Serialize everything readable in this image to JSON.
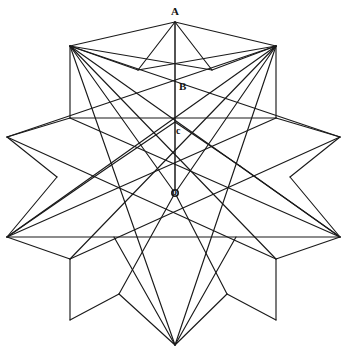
{
  "figure": {
    "type": "geometric-line-diagram",
    "canvas": {
      "width": 349,
      "height": 356,
      "background": "#ffffff"
    },
    "stroke_color": "#1a1a1a",
    "labels": [
      {
        "id": "A",
        "text": "A",
        "x": 175,
        "y": 13,
        "role": "apex-vertex"
      },
      {
        "id": "B",
        "text": "B",
        "x": 183,
        "y": 87,
        "role": "upper-intersection"
      },
      {
        "id": "c",
        "text": "c",
        "x": 180,
        "y": 131,
        "role": "mid-intersection"
      },
      {
        "id": "o",
        "text": "o",
        "x": 176,
        "y": 192,
        "role": "center-point"
      }
    ],
    "axis": {
      "label": "vertical-axis",
      "from": {
        "x": 175,
        "y": 22
      },
      "to": {
        "x": 175,
        "y": 193
      }
    },
    "center": {
      "x": 175,
      "y": 193
    },
    "outer_star_points": [
      {
        "name": "top",
        "x": 175,
        "y": 22
      },
      {
        "name": "upper-right-outer",
        "x": 340,
        "y": 137
      },
      {
        "name": "right-outer",
        "x": 340,
        "y": 237
      },
      {
        "name": "lower-right",
        "x": 276,
        "y": 320
      },
      {
        "name": "bottom",
        "x": 175,
        "y": 345
      },
      {
        "name": "lower-left",
        "x": 70,
        "y": 320
      },
      {
        "name": "left-outer",
        "x": 7,
        "y": 237
      },
      {
        "name": "upper-left-outer",
        "x": 7,
        "y": 137
      },
      {
        "name": "upper-left",
        "x": 70,
        "y": 46
      },
      {
        "name": "upper-right",
        "x": 276,
        "y": 46
      }
    ],
    "inner_pentagon_vertices": [
      {
        "x": 175,
        "y": 122
      },
      {
        "x": 273,
        "y": 193
      },
      {
        "x": 236,
        "y": 308
      },
      {
        "x": 114,
        "y": 308
      },
      {
        "x": 77,
        "y": 193
      }
    ]
  }
}
